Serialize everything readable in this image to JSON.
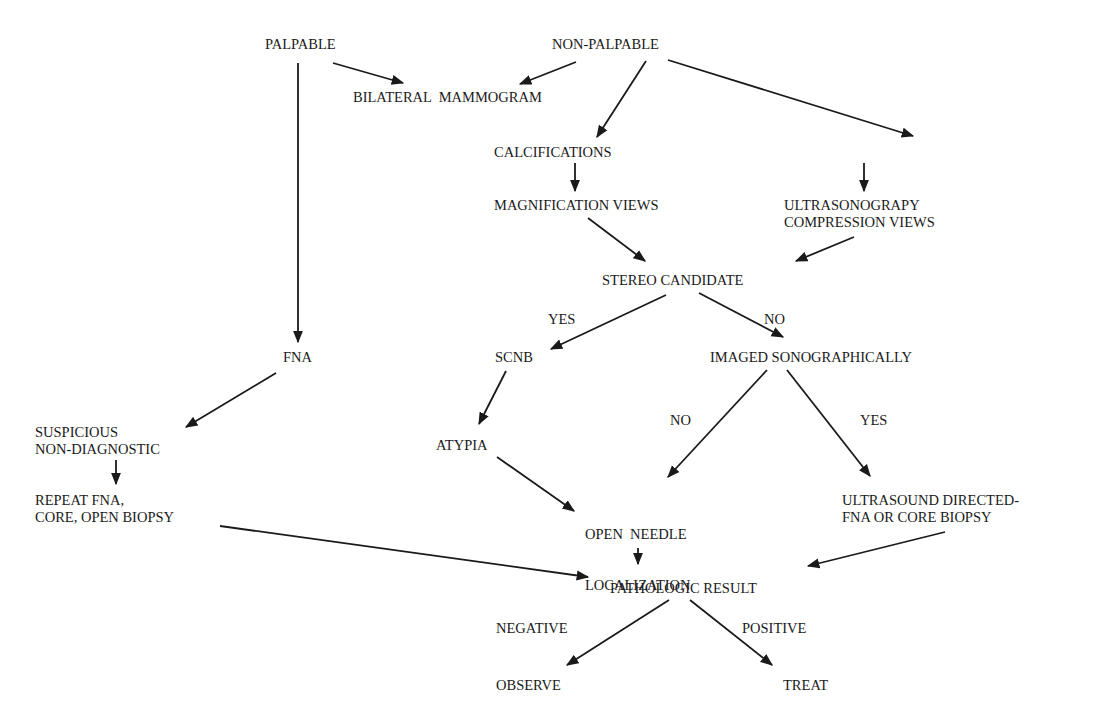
{
  "diagram": {
    "type": "flowchart",
    "nodes": {
      "palpable": "PALPABLE",
      "non_palpable": "NON-PALPABLE",
      "bilateral_mammogram": "BILATERAL  MAMMOGRAM",
      "calcifications": "CALCIFICATIONS",
      "architectural_abnormality": "ARCHITECTUAL ABNORMALITY",
      "magnification_views": "MAGNIFICATION VIEWS",
      "ultrasonography_l1": "ULTRASONOGRAPY",
      "ultrasonography_l2": "COMPRESSION VIEWS",
      "stereo_candidate": "STEREO CANDIDATE",
      "fna": "FNA",
      "scnb": "SCNB",
      "imaged_sonographically": "IMAGED SONOGRAPHICALLY",
      "suspicious_l1": "SUSPICIOUS",
      "suspicious_l2": "NON-DIAGNOSTIC",
      "atypia": "ATYPIA",
      "repeat_l1": "REPEAT FNA,",
      "repeat_l2": "CORE, OPEN BIOPSY",
      "open_needle_l1": "OPEN  NEEDLE",
      "open_needle_l2": "LOCALIZATION",
      "us_directed_l1": "ULTRASOUND DIRECTED-",
      "us_directed_l2": "FNA OR CORE BIOPSY",
      "pathologic_result": "PATHOLOGIC RESULT",
      "observe": "OBSERVE",
      "treat": "TREAT"
    },
    "edge_labels": {
      "stereo_yes": "YES",
      "stereo_no": "NO",
      "imaged_no": "NO",
      "imaged_yes": "YES",
      "negative": "NEGATIVE",
      "positive": "POSITIVE"
    },
    "edges": [
      {
        "from": "PALPABLE",
        "to": "BILATERAL MAMMOGRAM"
      },
      {
        "from": "PALPABLE",
        "to": "FNA"
      },
      {
        "from": "NON-PALPABLE",
        "to": "BILATERAL MAMMOGRAM"
      },
      {
        "from": "NON-PALPABLE",
        "to": "CALCIFICATIONS"
      },
      {
        "from": "NON-PALPABLE",
        "to": "ARCHITECTUAL ABNORMALITY"
      },
      {
        "from": "CALCIFICATIONS",
        "to": "MAGNIFICATION VIEWS"
      },
      {
        "from": "ARCHITECTUAL ABNORMALITY",
        "to": "ULTRASONOGRAPY COMPRESSION VIEWS"
      },
      {
        "from": "MAGNIFICATION VIEWS",
        "to": "STEREO CANDIDATE"
      },
      {
        "from": "ULTRASONOGRAPY COMPRESSION VIEWS",
        "to": "STEREO CANDIDATE"
      },
      {
        "from": "STEREO CANDIDATE",
        "to": "SCNB",
        "label": "YES"
      },
      {
        "from": "STEREO CANDIDATE",
        "to": "IMAGED SONOGRAPHICALLY",
        "label": "NO"
      },
      {
        "from": "FNA",
        "to": "SUSPICIOUS NON-DIAGNOSTIC"
      },
      {
        "from": "SUSPICIOUS NON-DIAGNOSTIC",
        "to": "REPEAT FNA, CORE, OPEN BIOPSY"
      },
      {
        "from": "SCNB",
        "to": "ATYPIA"
      },
      {
        "from": "IMAGED SONOGRAPHICALLY",
        "to": "OPEN NEEDLE LOCALIZATION",
        "label": "NO"
      },
      {
        "from": "IMAGED SONOGRAPHICALLY",
        "to": "ULTRASOUND DIRECTED-FNA OR CORE BIOPSY",
        "label": "YES"
      },
      {
        "from": "ATYPIA",
        "to": "OPEN NEEDLE LOCALIZATION"
      },
      {
        "from": "REPEAT FNA, CORE, OPEN BIOPSY",
        "to": "PATHOLOGIC RESULT"
      },
      {
        "from": "OPEN NEEDLE LOCALIZATION",
        "to": "PATHOLOGIC RESULT"
      },
      {
        "from": "ULTRASOUND DIRECTED-FNA OR CORE BIOPSY",
        "to": "PATHOLOGIC RESULT"
      },
      {
        "from": "PATHOLOGIC RESULT",
        "to": "OBSERVE",
        "label": "NEGATIVE"
      },
      {
        "from": "PATHOLOGIC RESULT",
        "to": "TREAT",
        "label": "POSITIVE"
      }
    ],
    "colors": {
      "background": "#ffffff",
      "ink": "#1a1a1a"
    }
  }
}
